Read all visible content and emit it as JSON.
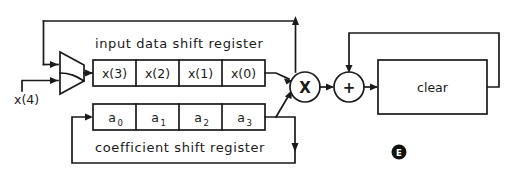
{
  "diagram": {
    "colors": {
      "line": "#1a1a1a",
      "background": "#ffffff",
      "badge_fill": "#111111",
      "badge_text": "#ffffff"
    },
    "input_shift_register": {
      "title": "input data shift register",
      "cells": [
        {
          "label": "x(3)"
        },
        {
          "label": "x(2)"
        },
        {
          "label": "x(1)"
        },
        {
          "label": "x(0)"
        }
      ]
    },
    "coefficient_shift_register": {
      "title": "coefficient shift register",
      "cells": [
        {
          "base": "a",
          "sub": "0"
        },
        {
          "base": "a",
          "sub": "1"
        },
        {
          "base": "a",
          "sub": "2"
        },
        {
          "base": "a",
          "sub": "3"
        }
      ]
    },
    "multiplexer": {
      "name": "input multiplexer",
      "inputs": [
        {
          "label": "feedback"
        },
        {
          "label": "x(4)"
        }
      ]
    },
    "external_input_label": "x(4)",
    "multiplier": {
      "symbol": "X",
      "name": "multiplier"
    },
    "adder": {
      "symbol": "+",
      "name": "adder"
    },
    "accumulator": {
      "label": "clear",
      "name": "accumulator register"
    },
    "figure_badge": {
      "letter": "E"
    }
  }
}
